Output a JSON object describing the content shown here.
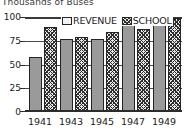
{
  "chart_data": {
    "type": "bar",
    "title": "Thousands of Buses",
    "subtitle": "",
    "xlabel": "",
    "ylabel": "",
    "ylim": [
      0,
      100
    ],
    "yticks": [
      0,
      25,
      50,
      75,
      100
    ],
    "ytick_labels": [
      "0",
      "25",
      "50",
      "75",
      "100"
    ],
    "grid": true,
    "grid_axis": "y",
    "legend_position": "top-center",
    "categories": [
      "1941",
      "1943",
      "1945",
      "1947",
      "1949"
    ],
    "series": [
      {
        "name": "REVENUE",
        "pattern": "solid-gray",
        "color": "#9a9a9a",
        "values": [
          58,
          77,
          77,
          92,
          92
        ]
      },
      {
        "name": "SCHOOL",
        "pattern": "cross-hatch",
        "color": "#2e2e2e",
        "values": [
          90,
          79,
          84,
          87,
          99
        ]
      }
    ]
  },
  "legend": {
    "items": [
      {
        "label": "REVENUE"
      },
      {
        "label": "SCHOOL"
      }
    ]
  },
  "axes": {
    "y": {
      "labels": [
        "100",
        "75",
        "50",
        "25",
        "0"
      ]
    },
    "x": {
      "labels": [
        "1941",
        "1943",
        "1945",
        "1947",
        "1949"
      ]
    }
  }
}
